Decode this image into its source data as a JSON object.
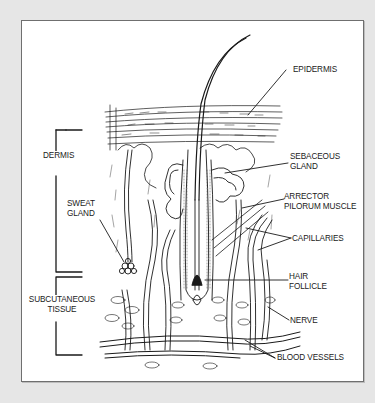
{
  "diagram": {
    "labels": {
      "epidermis": "EPIDERMIS",
      "sebaceous_gland": [
        "SEBACEOUS",
        "GLAND"
      ],
      "arrector_pilorum": [
        "ARRECTOR",
        "PILORUM MUSCLE"
      ],
      "capillaries": "CAPILLARIES",
      "hair_follicle": [
        "HAIR",
        "FOLLICLE"
      ],
      "nerve": "NERVE",
      "blood_vessels": "BLOOD VESSELS",
      "dermis": "DERMIS",
      "sweat_gland": [
        "SWEAT",
        "GLAND"
      ],
      "subcutaneous_tissue": [
        "SUBCUTANEOUS",
        "TISSUE"
      ]
    },
    "colors": {
      "background": "#e6e6e6",
      "panel": "#ffffff",
      "ink": "#1a1a1a",
      "border": "#6f6f6f"
    }
  }
}
